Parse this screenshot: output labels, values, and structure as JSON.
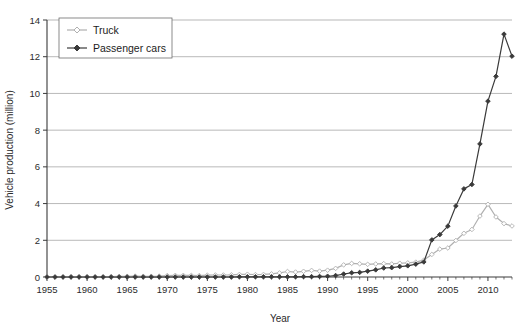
{
  "chart_data": {
    "type": "line",
    "title": "",
    "xlabel": "Year",
    "ylabel": "Vehicle production (million)",
    "xlim": [
      1955,
      2013
    ],
    "ylim": [
      0,
      14
    ],
    "ytick_step": 2,
    "xtick_step": 5,
    "grid": "horizontal",
    "legend_position": "top-left",
    "yticks": [
      "0",
      "2",
      "4",
      "6",
      "8",
      "10",
      "12",
      "14"
    ],
    "xticks": [
      "1955",
      "1960",
      "1965",
      "1970",
      "1975",
      "1980",
      "1985",
      "1990",
      "1995",
      "2000",
      "2005",
      "2010"
    ],
    "x": [
      1955,
      1956,
      1957,
      1958,
      1959,
      1960,
      1961,
      1962,
      1963,
      1964,
      1965,
      1966,
      1967,
      1968,
      1969,
      1970,
      1971,
      1972,
      1973,
      1974,
      1975,
      1976,
      1977,
      1978,
      1979,
      1980,
      1981,
      1982,
      1983,
      1984,
      1985,
      1986,
      1987,
      1988,
      1989,
      1990,
      1991,
      1992,
      1993,
      1994,
      1995,
      1996,
      1997,
      1998,
      1999,
      2000,
      2001,
      2002,
      2003,
      2004,
      2005,
      2006,
      2007,
      2008,
      2009,
      2010,
      2011,
      2012,
      2013
    ],
    "series": [
      {
        "name": "Truck",
        "color": "#b0b0b0",
        "marker": "diamond-open",
        "values": [
          0.0,
          0.0,
          0.01,
          0.02,
          0.02,
          0.02,
          0.01,
          0.01,
          0.02,
          0.03,
          0.04,
          0.05,
          0.04,
          0.04,
          0.05,
          0.08,
          0.09,
          0.09,
          0.09,
          0.08,
          0.1,
          0.11,
          0.11,
          0.12,
          0.14,
          0.15,
          0.13,
          0.14,
          0.17,
          0.22,
          0.3,
          0.27,
          0.31,
          0.36,
          0.32,
          0.37,
          0.47,
          0.66,
          0.74,
          0.72,
          0.69,
          0.71,
          0.73,
          0.71,
          0.75,
          0.77,
          0.81,
          0.92,
          1.23,
          1.52,
          1.58,
          1.99,
          2.38,
          2.59,
          3.32,
          3.96,
          3.27,
          2.91,
          2.78
        ]
      },
      {
        "name": "Passenger cars",
        "color": "#3a3a3a",
        "marker": "diamond-filled",
        "values": [
          0.0,
          0.0,
          0.0,
          0.0,
          0.0,
          0.0,
          0.0,
          0.0,
          0.0,
          0.0,
          0.0,
          0.0,
          0.0,
          0.0,
          0.0,
          0.0,
          0.0,
          0.0,
          0.0,
          0.0,
          0.0,
          0.0,
          0.0,
          0.0,
          0.01,
          0.01,
          0.01,
          0.01,
          0.01,
          0.01,
          0.01,
          0.01,
          0.02,
          0.02,
          0.03,
          0.04,
          0.08,
          0.16,
          0.23,
          0.25,
          0.32,
          0.39,
          0.49,
          0.51,
          0.57,
          0.61,
          0.7,
          0.82,
          2.02,
          2.31,
          2.77,
          3.87,
          4.8,
          5.04,
          7.25,
          9.58,
          10.93,
          13.23,
          12.03
        ]
      }
    ]
  },
  "legend": {
    "items": [
      {
        "label": "Truck",
        "color": "#b0b0b0",
        "marker": "diamond-open"
      },
      {
        "label": "Passenger cars",
        "color": "#3a3a3a",
        "marker": "diamond-filled"
      }
    ]
  },
  "axes": {
    "x_title": "Year",
    "y_title": "Vehicle production (million)"
  }
}
